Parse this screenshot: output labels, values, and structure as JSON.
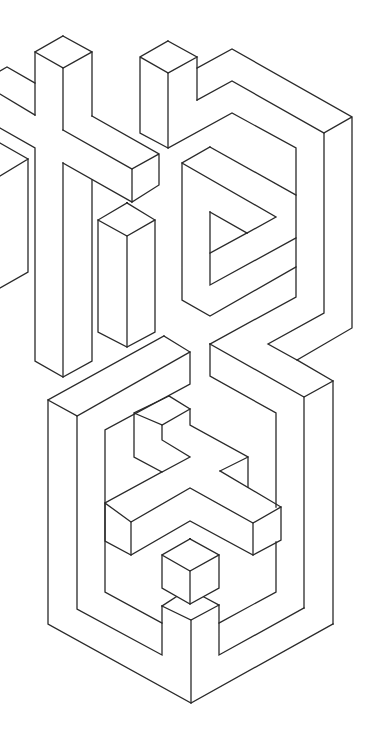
{
  "artwork": {
    "title": "",
    "background": "#ffffff",
    "stroke_color": "#2a2a2a",
    "stroke_width": 1.3,
    "width": 368,
    "height": 732,
    "groups": [
      {
        "name": "upper-left-cross",
        "paths": [
          [
            [
              63,
              36
            ],
            [
              35,
              52
            ],
            [
              35,
              115
            ]
          ],
          [
            [
              63,
              36
            ],
            [
              92,
              52
            ],
            [
              92,
              116
            ]
          ],
          [
            [
              35,
              52
            ],
            [
              63,
              68
            ],
            [
              63,
              130
            ]
          ],
          [
            [
              63,
              68
            ],
            [
              92,
              52
            ]
          ],
          [
            [
              0,
              71
            ],
            [
              7,
              67
            ],
            [
              35,
              83
            ]
          ],
          [
            [
              0,
              94
            ],
            [
              35,
              115
            ]
          ],
          [
            [
              0,
              128
            ],
            [
              35,
              148
            ],
            [
              35,
              361
            ],
            [
              63,
              377
            ],
            [
              92,
              361
            ],
            [
              92,
              180
            ]
          ],
          [
            [
              63,
              163
            ],
            [
              63,
              377
            ]
          ],
          [
            [
              92,
              116
            ],
            [
              159,
              154
            ],
            [
              159,
              185
            ],
            [
              132,
              202
            ],
            [
              132,
              169
            ],
            [
              159,
              154
            ]
          ],
          [
            [
              63,
              130
            ],
            [
              132,
              169
            ]
          ],
          [
            [
              63,
              163
            ],
            [
              132,
              202
            ]
          ]
        ]
      },
      {
        "name": "left-edge-block",
        "paths": [
          [
            [
              0,
              143
            ],
            [
              28,
              159
            ],
            [
              0,
              176
            ]
          ],
          [
            [
              28,
              159
            ],
            [
              28,
              272
            ],
            [
              0,
              288
            ]
          ]
        ]
      },
      {
        "name": "middle-tall-box",
        "paths": [
          [
            [
              127,
              203
            ],
            [
              98,
              220
            ],
            [
              98,
              332
            ],
            [
              127,
              347
            ],
            [
              155,
              332
            ],
            [
              155,
              220
            ],
            [
              127,
              203
            ]
          ],
          [
            [
              98,
              220
            ],
            [
              127,
              236
            ],
            [
              155,
              220
            ]
          ],
          [
            [
              127,
              236
            ],
            [
              127,
              347
            ]
          ]
        ]
      },
      {
        "name": "upper-right-box",
        "paths": [
          [
            [
              168,
              41
            ],
            [
              140,
              57
            ],
            [
              140,
              133
            ],
            [
              168,
              148
            ],
            [
              168,
              73
            ],
            [
              140,
              57
            ]
          ],
          [
            [
              168,
              41
            ],
            [
              197,
              57
            ],
            [
              168,
              73
            ]
          ],
          [
            [
              197,
              57
            ],
            [
              197,
              100
            ]
          ]
        ]
      },
      {
        "name": "upper-right-frame",
        "paths": [
          [
            [
              197,
              68
            ],
            [
              232,
              49
            ],
            [
              352,
              117
            ],
            [
              352,
              328
            ],
            [
              297,
              360
            ],
            [
              268,
              344
            ],
            [
              324,
              313
            ],
            [
              324,
              133
            ],
            [
              352,
              117
            ]
          ],
          [
            [
              197,
              100
            ],
            [
              232,
              81
            ],
            [
              324,
              133
            ]
          ],
          [
            [
              168,
              148
            ],
            [
              232,
              113
            ],
            [
              296,
              148
            ],
            [
              296,
              297
            ],
            [
              210,
              344
            ]
          ]
        ]
      },
      {
        "name": "inner-p-shape",
        "paths": [
          [
            [
              210,
              147
            ],
            [
              182,
              163
            ],
            [
              182,
              300
            ],
            [
              210,
              316
            ],
            [
              296,
              267
            ]
          ],
          [
            [
              210,
              147
            ],
            [
              296,
              195
            ]
          ],
          [
            [
              182,
              163
            ],
            [
              276,
              217
            ],
            [
              247,
              233
            ]
          ],
          [
            [
              210,
              212
            ],
            [
              247,
              233
            ]
          ],
          [
            [
              210,
              253
            ],
            [
              247,
              233
            ]
          ],
          [
            [
              210,
              212
            ],
            [
              210,
              285
            ],
            [
              296,
              238
            ]
          ]
        ]
      },
      {
        "name": "right-connector",
        "paths": [
          [
            [
              210,
              344
            ],
            [
              304,
              397
            ],
            [
              333,
              381
            ],
            [
              297,
              360
            ]
          ],
          [
            [
              304,
              397
            ],
            [
              304,
              608
            ]
          ],
          [
            [
              333,
              381
            ],
            [
              333,
              624
            ]
          ],
          [
            [
              210,
              344
            ],
            [
              210,
              376
            ],
            [
              276,
              413
            ],
            [
              276,
              507
            ]
          ],
          [
            [
              276,
              542
            ],
            [
              276,
              592
            ],
            [
              219,
              623
            ]
          ]
        ]
      },
      {
        "name": "lower-outer-frame",
        "paths": [
          [
            [
              164,
              336
            ],
            [
              48,
              400
            ],
            [
              48,
              624
            ],
            [
              191,
              703
            ],
            [
              333,
              624
            ]
          ],
          [
            [
              164,
              336
            ],
            [
              190,
              352
            ],
            [
              190,
              384
            ],
            [
              105,
              430
            ],
            [
              105,
              592
            ],
            [
              162,
              623
            ]
          ],
          [
            [
              48,
              400
            ],
            [
              77,
              416
            ],
            [
              77,
              609
            ],
            [
              162,
              655
            ],
            [
              162,
              606
            ]
          ],
          [
            [
              77,
              416
            ],
            [
              190,
              352
            ]
          ],
          [
            [
              162,
              606
            ],
            [
              191,
              620
            ],
            [
              219,
              605
            ],
            [
              219,
              655
            ],
            [
              304,
              608
            ]
          ],
          [
            [
              191,
              620
            ],
            [
              191,
              703
            ]
          ],
          [
            [
              176,
              597
            ],
            [
              162,
              606
            ]
          ],
          [
            [
              204,
              597
            ],
            [
              219,
              605
            ]
          ]
        ]
      },
      {
        "name": "lower-inner-strokes",
        "paths": [
          [
            [
              169,
              396
            ],
            [
              134,
              413
            ],
            [
              134,
              457
            ],
            [
              162,
              472
            ],
            [
              190,
              457
            ],
            [
              162,
              440
            ],
            [
              162,
              425
            ],
            [
              134,
              413
            ]
          ],
          [
            [
              162,
              425
            ],
            [
              190,
              409
            ],
            [
              169,
              396
            ]
          ],
          [
            [
              190,
              409
            ],
            [
              190,
              425
            ],
            [
              248,
              457
            ],
            [
              248,
              487
            ]
          ],
          [
            [
              220,
              471
            ],
            [
              248,
              457
            ]
          ]
        ]
      },
      {
        "name": "crossbar",
        "paths": [
          [
            [
              162,
              472
            ],
            [
              105,
              503
            ],
            [
              105,
              541
            ],
            [
              131,
              555
            ],
            [
              190,
              521
            ],
            [
              253,
              555
            ],
            [
              281,
              540
            ],
            [
              281,
              507
            ],
            [
              220,
              471
            ]
          ],
          [
            [
              105,
              503
            ],
            [
              131,
              522
            ],
            [
              190,
              488
            ],
            [
              253,
              523
            ],
            [
              281,
              507
            ]
          ],
          [
            [
              131,
              522
            ],
            [
              131,
              555
            ]
          ],
          [
            [
              253,
              523
            ],
            [
              253,
              555
            ]
          ]
        ]
      },
      {
        "name": "small-cube",
        "paths": [
          [
            [
              190,
              539
            ],
            [
              162,
              555
            ],
            [
              162,
              588
            ],
            [
              190,
              604
            ],
            [
              219,
              588
            ],
            [
              219,
              555
            ],
            [
              190,
              539
            ]
          ],
          [
            [
              162,
              555
            ],
            [
              190,
              571
            ],
            [
              219,
              555
            ]
          ],
          [
            [
              190,
              571
            ],
            [
              190,
              604
            ]
          ]
        ]
      }
    ]
  }
}
